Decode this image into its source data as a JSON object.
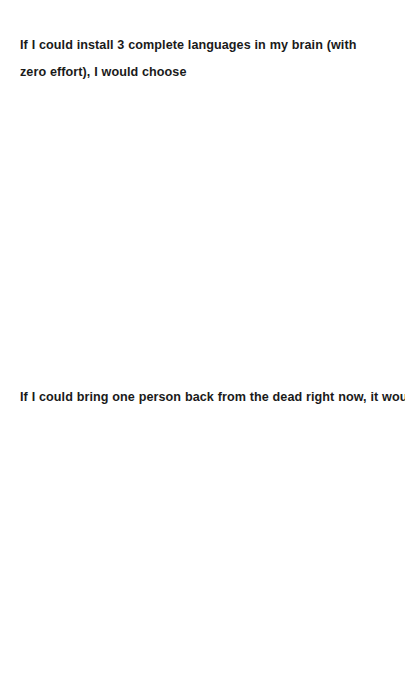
{
  "page": {
    "background_color": "#ffffff",
    "text_color": "#1a1a1a"
  },
  "prompts": [
    {
      "id": "languages",
      "text": "If I could install 3 complete languages in my brain (with zero effort), I would choose",
      "answer_placeholder": ""
    },
    {
      "id": "person",
      "text": "If I could bring one person back from the dead right now, it would be",
      "answer_placeholder": ""
    }
  ]
}
